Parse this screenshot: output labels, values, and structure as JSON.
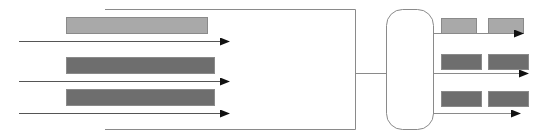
{
  "diagram": {
    "type": "flow-schematic",
    "colors": {
      "background": "#ffffff",
      "line": "#8a8a8a",
      "arrow_line": "#555555",
      "arrowhead": "#111111",
      "bar_light": "#a9a9a9",
      "bar_dark": "#6e6e6e",
      "bar_border": "#8a8a8a"
    },
    "left_inputs": [
      {
        "bar": {
          "x": 66,
          "y": 17,
          "w": 141,
          "h": 16,
          "shade": "light"
        },
        "arrow": {
          "x1": 19,
          "x2": 229,
          "y": 41
        }
      },
      {
        "bar": {
          "x": 66,
          "y": 57,
          "w": 148,
          "h": 16,
          "shade": "dark"
        },
        "arrow": {
          "x1": 19,
          "x2": 229,
          "y": 81
        }
      },
      {
        "bar": {
          "x": 66,
          "y": 89,
          "w": 148,
          "h": 16,
          "shade": "dark"
        },
        "arrow": {
          "x1": 19,
          "x2": 229,
          "y": 113
        }
      }
    ],
    "bracket": {
      "x_start": 105,
      "x_end": 355,
      "y_top": 9,
      "y_bottom": 129
    },
    "connector": {
      "x1": 355,
      "x2": 386,
      "y": 73
    },
    "hub": {
      "x": 386,
      "y": 9,
      "w": 47,
      "h": 120,
      "radius": 16
    },
    "right_outputs": [
      {
        "bars": [
          {
            "x": 441,
            "y": 18,
            "w": 35,
            "h": 15,
            "shade": "light"
          },
          {
            "x": 488,
            "y": 18,
            "w": 35,
            "h": 15,
            "shade": "light"
          }
        ],
        "arrow": {
          "x1": 433,
          "x2": 523,
          "y": 33
        }
      },
      {
        "bars": [
          {
            "x": 441,
            "y": 54,
            "w": 40,
            "h": 15,
            "shade": "dark"
          },
          {
            "x": 488,
            "y": 54,
            "w": 40,
            "h": 15,
            "shade": "dark"
          }
        ],
        "arrow": {
          "x1": 433,
          "x2": 528,
          "y": 73
        }
      },
      {
        "bars": [
          {
            "x": 441,
            "y": 91,
            "w": 40,
            "h": 15,
            "shade": "dark"
          },
          {
            "x": 488,
            "y": 91,
            "w": 40,
            "h": 15,
            "shade": "dark"
          }
        ],
        "arrow": {
          "x1": 433,
          "x2": 520,
          "y": 113
        }
      }
    ]
  }
}
